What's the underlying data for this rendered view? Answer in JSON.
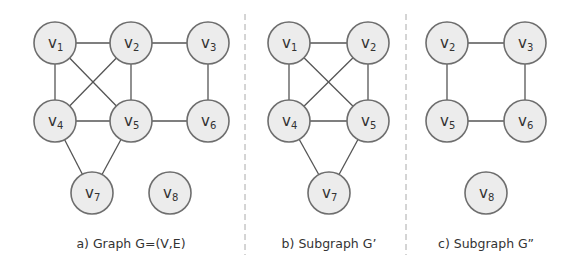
{
  "colors": {
    "node_fill": "#ececec",
    "node_stroke": "#6e6e6e",
    "edge": "#555555",
    "divider": "#aaaaaa",
    "text": "#333333"
  },
  "radius": 21,
  "panels": [
    {
      "id": "a",
      "caption": "a) Graph G=(V,E)",
      "caption_x": 131,
      "nodes": [
        {
          "id": "v1",
          "label": "v",
          "sub": "1",
          "x": 55,
          "y": 43
        },
        {
          "id": "v2",
          "label": "v",
          "sub": "2",
          "x": 131,
          "y": 43
        },
        {
          "id": "v3",
          "label": "v",
          "sub": "3",
          "x": 208,
          "y": 43
        },
        {
          "id": "v4",
          "label": "v",
          "sub": "4",
          "x": 55,
          "y": 121
        },
        {
          "id": "v5",
          "label": "v",
          "sub": "5",
          "x": 131,
          "y": 121
        },
        {
          "id": "v6",
          "label": "v",
          "sub": "6",
          "x": 208,
          "y": 121
        },
        {
          "id": "v7",
          "label": "v",
          "sub": "7",
          "x": 92,
          "y": 193
        },
        {
          "id": "v8",
          "label": "v",
          "sub": "8",
          "x": 170,
          "y": 193
        }
      ],
      "edges": [
        [
          "v1",
          "v2"
        ],
        [
          "v2",
          "v3"
        ],
        [
          "v1",
          "v4"
        ],
        [
          "v1",
          "v5"
        ],
        [
          "v2",
          "v4"
        ],
        [
          "v2",
          "v5"
        ],
        [
          "v3",
          "v6"
        ],
        [
          "v4",
          "v5"
        ],
        [
          "v5",
          "v6"
        ],
        [
          "v4",
          "v7"
        ],
        [
          "v5",
          "v7"
        ]
      ]
    },
    {
      "id": "b",
      "caption": "b) Subgraph G’",
      "caption_x": 329,
      "nodes": [
        {
          "id": "v1",
          "label": "v",
          "sub": "1",
          "x": 289,
          "y": 43
        },
        {
          "id": "v2",
          "label": "v",
          "sub": "2",
          "x": 368,
          "y": 43
        },
        {
          "id": "v4",
          "label": "v",
          "sub": "4",
          "x": 289,
          "y": 121
        },
        {
          "id": "v5",
          "label": "v",
          "sub": "5",
          "x": 368,
          "y": 121
        },
        {
          "id": "v7",
          "label": "v",
          "sub": "7",
          "x": 329,
          "y": 193
        }
      ],
      "edges": [
        [
          "v1",
          "v2"
        ],
        [
          "v1",
          "v4"
        ],
        [
          "v1",
          "v5"
        ],
        [
          "v2",
          "v4"
        ],
        [
          "v2",
          "v5"
        ],
        [
          "v4",
          "v5"
        ],
        [
          "v4",
          "v7"
        ],
        [
          "v5",
          "v7"
        ]
      ]
    },
    {
      "id": "c",
      "caption": "c) Subgraph G”",
      "caption_x": 486,
      "nodes": [
        {
          "id": "v2",
          "label": "v",
          "sub": "2",
          "x": 447,
          "y": 43
        },
        {
          "id": "v3",
          "label": "v",
          "sub": "3",
          "x": 525,
          "y": 43
        },
        {
          "id": "v5",
          "label": "v",
          "sub": "5",
          "x": 447,
          "y": 121
        },
        {
          "id": "v6",
          "label": "v",
          "sub": "6",
          "x": 525,
          "y": 121
        },
        {
          "id": "v8",
          "label": "v",
          "sub": "8",
          "x": 486,
          "y": 193
        }
      ],
      "edges": [
        [
          "v2",
          "v3"
        ],
        [
          "v2",
          "v5"
        ],
        [
          "v3",
          "v6"
        ],
        [
          "v5",
          "v6"
        ]
      ]
    }
  ],
  "dividers": [
    245,
    406
  ],
  "caption_y": 248
}
